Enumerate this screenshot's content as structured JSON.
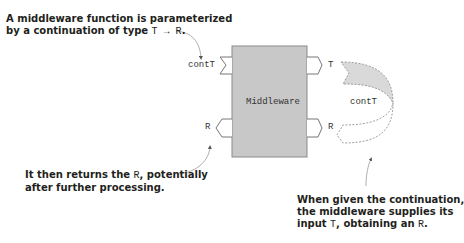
{
  "annotations": {
    "top_left": {
      "line1": "A middleware function is parameterized",
      "line2_prefix": "by a continuation of type ",
      "line2_type": "T → R",
      "line2_suffix": "."
    },
    "bottom_left": {
      "line1_prefix": "It then returns the ",
      "line1_code": "R",
      "line1_suffix": ", potentially",
      "line2": "after further processing."
    },
    "bottom_right": {
      "line1": "When given the continuation,",
      "line2": "the middleware supplies its",
      "line3_prefix": "input ",
      "line3_code_t": "T",
      "line3_mid": ", obtaining an ",
      "line3_code_r": "R",
      "line3_suffix": "."
    }
  },
  "diagram": {
    "box_label": "Middleware",
    "left_top_port": "contT",
    "left_bottom_port": "R",
    "right_top_port": "T",
    "right_bottom_port": "R",
    "continuation_label": "contT"
  },
  "colors": {
    "box_fill": "#c8c8c8",
    "box_stroke": "#8a8a8a",
    "cont_fill": "#d9d9d9",
    "text": "#231f20",
    "arrow": "#777777"
  }
}
